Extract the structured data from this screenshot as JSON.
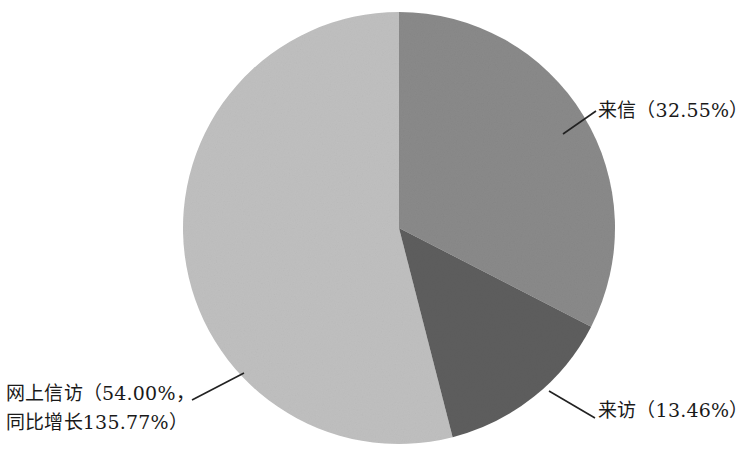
{
  "chart_data": {
    "type": "pie",
    "title": "",
    "categories": [
      "来信",
      "来访",
      "网上信访"
    ],
    "values": [
      32.55,
      13.46,
      54.0
    ],
    "value_unit": "%",
    "start_angle_deg": 0,
    "direction": "clockwise",
    "legend": "none",
    "grid": false,
    "slices": [
      {
        "name": "来信",
        "value": 32.55,
        "label": "来信（32.55%）",
        "color": "#8a8a8a",
        "start_deg": 0,
        "end_deg": 117.18
      },
      {
        "name": "来访",
        "value": 13.46,
        "label": "来访（13.46%）",
        "color": "#5e5e5e",
        "start_deg": 117.18,
        "end_deg": 165.64
      },
      {
        "name": "网上信访",
        "value": 54.0,
        "label_line1": "网上信访（54.00%，",
        "label_line2": "同比增长135.77%）",
        "growth_yoy": 135.77,
        "color": "#c0c0c0",
        "start_deg": 165.64,
        "end_deg": 360
      }
    ]
  },
  "labels": {
    "letters": "来信（32.55%）",
    "visits": "来访（13.46%）",
    "online_line1": "网上信访（54.00%，",
    "online_line2": "同比增长135.77%）"
  },
  "colors": {
    "slice_letters": "#8a8a8a",
    "slice_visits": "#5e5e5e",
    "slice_online": "#c0c0c0",
    "leader_line": "#222222",
    "background": "#ffffff",
    "text": "#1a1a1a"
  }
}
